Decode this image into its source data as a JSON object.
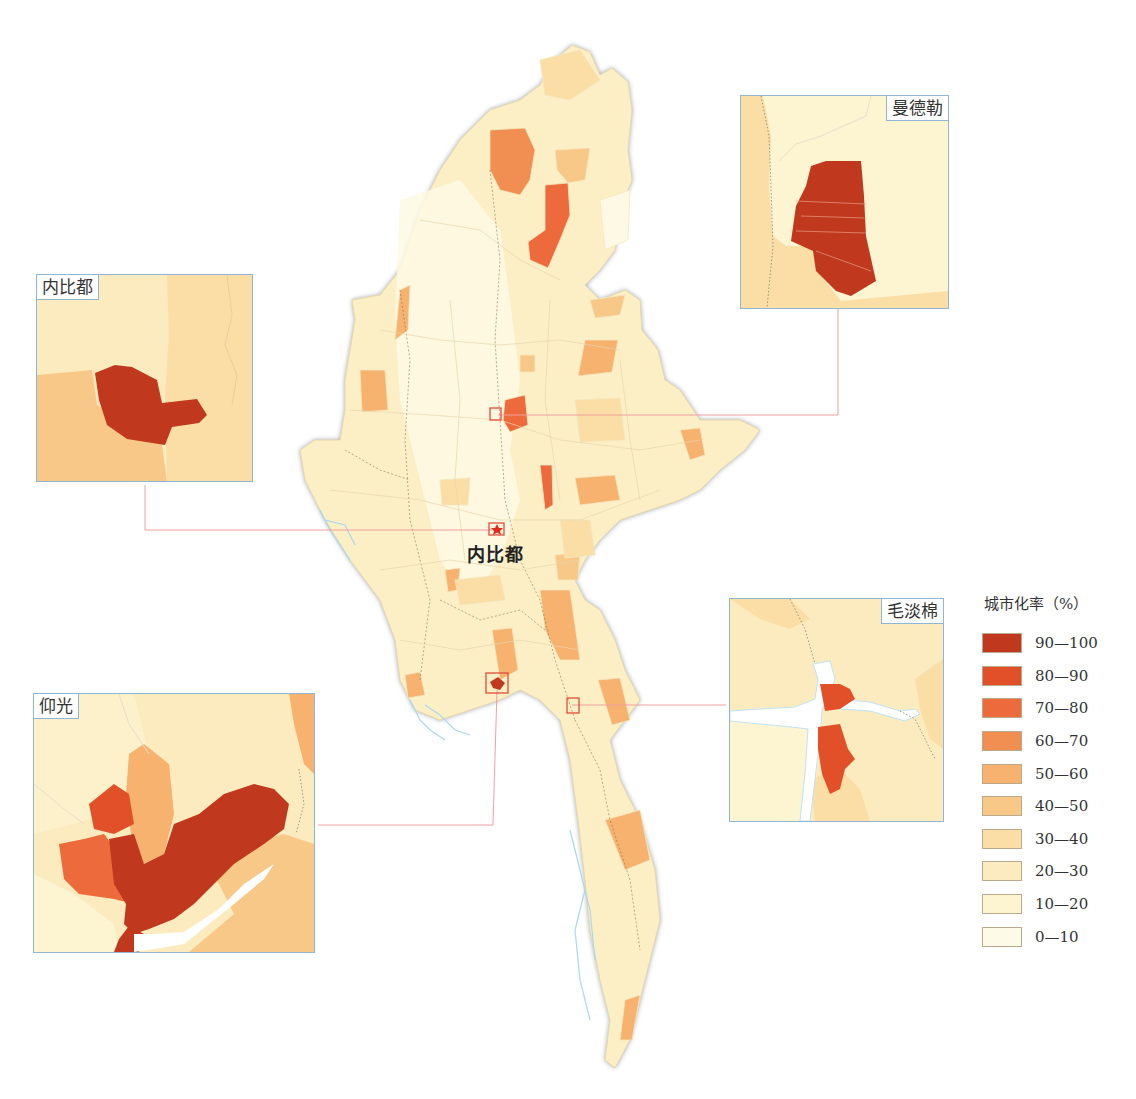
{
  "map": {
    "subject": "Myanmar urbanization rate by township",
    "capital": {
      "label": "内比都",
      "marker": "star-icon"
    }
  },
  "insets": [
    {
      "id": "naypyidaw",
      "label": "内比都"
    },
    {
      "id": "mandalay",
      "label": "曼德勒"
    },
    {
      "id": "yangon",
      "label": "仰光"
    },
    {
      "id": "mawlamyine",
      "label": "毛淡棉"
    }
  ],
  "legend": {
    "title": "城市化率（%）",
    "classes": [
      {
        "label": "90—100",
        "color": "#c0391e"
      },
      {
        "label": "80—90",
        "color": "#e2502a"
      },
      {
        "label": "70—80",
        "color": "#ec6a3c"
      },
      {
        "label": "60—70",
        "color": "#f18f52"
      },
      {
        "label": "50—60",
        "color": "#f6b26e"
      },
      {
        "label": "40—50",
        "color": "#f8c888"
      },
      {
        "label": "30—40",
        "color": "#fadea5"
      },
      {
        "label": "20—30",
        "color": "#fcebbf"
      },
      {
        "label": "10—20",
        "color": "#fdf4d2"
      },
      {
        "label": "0—10",
        "color": "#fefae8"
      }
    ]
  },
  "colors": {
    "border_shadow": "#7d8596",
    "water": "#bfe3f5",
    "connector": "#f0a0a0",
    "inset_frame": "#8fb6d4"
  }
}
